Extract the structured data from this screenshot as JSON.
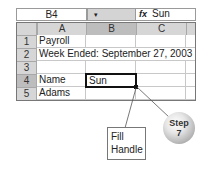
{
  "formula_bar": {
    "name_box": "B4",
    "dropdown_icon": "▾",
    "fx_icon": "fx",
    "value": "Sun"
  },
  "columns": [
    "A",
    "B",
    "C"
  ],
  "rows": [
    {
      "num": "1",
      "A": "Payroll",
      "B": "",
      "C": ""
    },
    {
      "num": "2",
      "A": "Week Ended: September 27, 2003",
      "B": "",
      "C": ""
    },
    {
      "num": "3",
      "A": "",
      "B": "",
      "C": ""
    },
    {
      "num": "4",
      "A": "Name",
      "B": "Sun",
      "C": ""
    },
    {
      "num": "5",
      "A": "Adams",
      "B": "",
      "C": ""
    }
  ],
  "active_cell": "B4",
  "callout": {
    "line1": "Fill",
    "line2": "Handle"
  },
  "step_badge": {
    "line1": "Step",
    "line2": "7"
  }
}
